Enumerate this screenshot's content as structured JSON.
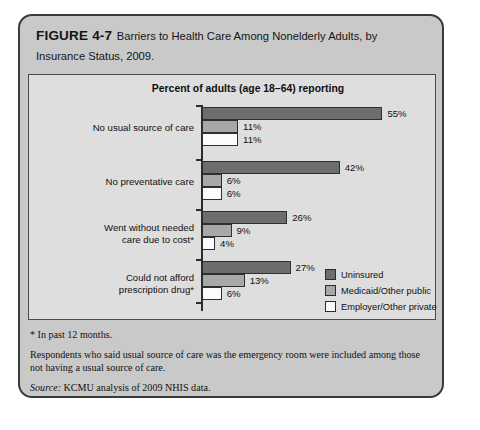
{
  "figure": {
    "number": "FIGURE 4-7",
    "title": "Barriers to Health Care Among Nonelderly Adults, by Insurance Status, 2009."
  },
  "chart_data": {
    "type": "bar",
    "orientation": "horizontal",
    "title": "Percent of adults (age 18–64) reporting",
    "xlabel": "",
    "ylabel": "",
    "xlim": [
      0,
      55
    ],
    "grid": false,
    "legend_position": "middle-right",
    "value_suffix": "%",
    "categories": [
      "No usual source of care",
      "No preventative care",
      "Went without needed care due to cost*",
      "Could not afford prescription drug*"
    ],
    "series": [
      {
        "name": "Uninsured",
        "color": "#6d6d6d",
        "values": [
          55,
          42,
          26,
          27
        ]
      },
      {
        "name": "Medicaid/Other public",
        "color": "#a8a8a8",
        "values": [
          11,
          6,
          9,
          13
        ]
      },
      {
        "name": "Employer/Other private",
        "color": "#fbfbfb",
        "values": [
          11,
          6,
          4,
          6
        ]
      }
    ],
    "labels": [
      [
        "55%",
        "11%",
        "11%"
      ],
      [
        "42%",
        "6%",
        "6%"
      ],
      [
        "26%",
        "9%",
        "4%"
      ],
      [
        "27%",
        "13%",
        "6%"
      ]
    ],
    "category_lines": [
      [
        "No usual source of care"
      ],
      [
        "No preventative care"
      ],
      [
        "Went without needed",
        "care due to cost*"
      ],
      [
        "Could not afford",
        "prescription drug*"
      ]
    ]
  },
  "notes": {
    "footnote": "* In past 12 months.",
    "methodology": "Respondents who said usual source of care was the emergency room were included among those not having a usual source of care.",
    "source_label": "Source:",
    "source_text": " KCMU analysis of 2009 NHIS data."
  }
}
